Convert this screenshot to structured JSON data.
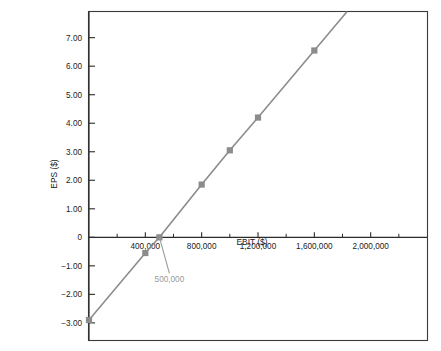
{
  "chart_data": {
    "type": "line",
    "title": "",
    "subtitle": "",
    "xlabel": "EBIT ($)",
    "ylabel": "EPS ($)",
    "xlim": [
      0,
      2400000
    ],
    "ylim": [
      -3.6,
      7.9
    ],
    "grid": false,
    "legend": null,
    "x": [
      0,
      400000,
      500000,
      800000,
      1000000,
      1200000,
      1600000
    ],
    "series": [
      {
        "name": "EPS",
        "values": [
          -2.9,
          -0.55,
          0.0,
          1.85,
          3.05,
          4.2,
          6.55
        ],
        "color": "#8c8c8c",
        "marker": "square"
      }
    ],
    "x_tick_labels": [
      "400,000",
      "800,000",
      "1,200,000",
      "1,600,000",
      "2,000,000"
    ],
    "x_tick_values": [
      400000,
      800000,
      1200000,
      1600000,
      2000000
    ],
    "x_minor_tick_values": [
      200000,
      600000,
      1000000,
      1400000,
      1800000,
      2200000
    ],
    "y_tick_labels": [
      "7.00",
      "6.00",
      "5.00",
      "4.00",
      "3.00",
      "2.00",
      "1.00",
      "0",
      "−1.00",
      "−2.00",
      "−3.00"
    ],
    "y_tick_values": [
      7,
      6,
      5,
      4,
      3,
      2,
      1,
      0,
      -1,
      -2,
      -3
    ],
    "annotations": [
      {
        "text": "500,000",
        "target_x": 500000,
        "target_y": 0,
        "color": "#9a9a9a"
      }
    ],
    "colors": {
      "series": "#8c8c8c",
      "annotation": "#9a9a9a",
      "axis": "#2b2b2b",
      "frame": "#3a3a3a",
      "text": "#1a1a1a",
      "background": "#ffffff"
    }
  }
}
